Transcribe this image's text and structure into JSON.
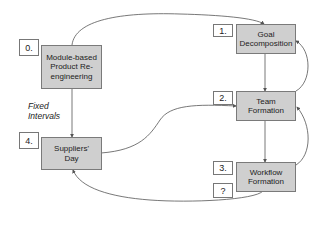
{
  "steps": [
    {
      "num": "0.",
      "label": "Module-based Product Re-engineering"
    },
    {
      "num": "1.",
      "label": "Goal Decomposition"
    },
    {
      "num": "2.",
      "label": "Team Formation"
    },
    {
      "num": "3.",
      "label": "Workflow Formation"
    },
    {
      "num": "4.",
      "label": "Suppliers' Day"
    }
  ],
  "unknown_label": "?",
  "note": {
    "line1": "Fixed",
    "line2": "Intervals"
  },
  "colors": {
    "box_fill": "#cfcfcf",
    "box_border": "#7a7a7a",
    "line": "#555555"
  }
}
